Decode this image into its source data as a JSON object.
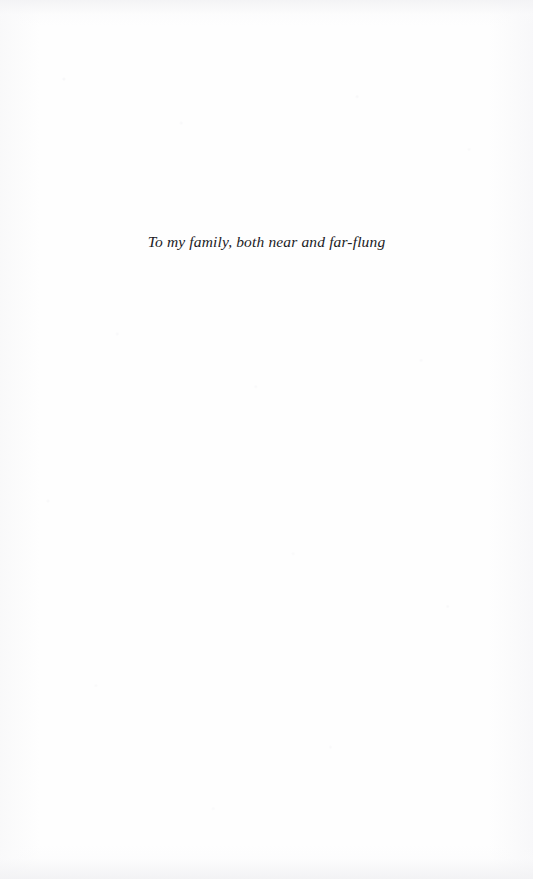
{
  "page": {
    "kind": "book-dedication-page",
    "background_color": "#fefefe",
    "ink_color": "#1b1b1f",
    "width": 533,
    "height": 879
  },
  "dedication": {
    "text": "To my family, both near and far-flung",
    "alignment": "center"
  }
}
